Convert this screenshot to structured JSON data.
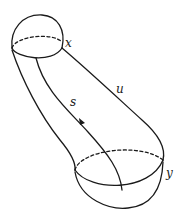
{
  "figure": {
    "type": "surface-cobordism-sketch",
    "colors": {
      "stroke": "#1a1a1a",
      "background": "#ffffff"
    }
  },
  "labels": {
    "x": "x",
    "y": "y",
    "s": "s",
    "u": "u"
  },
  "elements": {
    "top_cap": {
      "boundary_point": "x",
      "back_edge": "dashed"
    },
    "bottom_cap": {
      "boundary_point": "y",
      "back_edge": "dashed"
    },
    "path_s": {
      "label": "s",
      "direction_arrow": "downward"
    },
    "path_u": {
      "label": "u"
    }
  }
}
